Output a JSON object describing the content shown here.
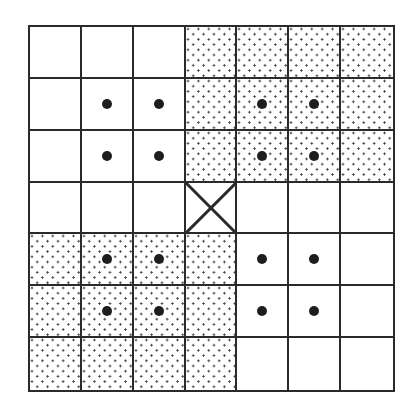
{
  "diagram": {
    "type": "grid",
    "rows": 7,
    "cols": 7,
    "colors": {
      "line": "#2a2a2a",
      "dot": "#1e1e1e",
      "stipple": "#3a3a3a",
      "background": "#ffffff"
    },
    "legend": {
      "stippled": "dotted-pattern fill",
      "marked": "large center dot",
      "center": "X-marked cell"
    },
    "cells": [
      [
        {
          "fill": "plain",
          "dot": false
        },
        {
          "fill": "plain",
          "dot": false
        },
        {
          "fill": "plain",
          "dot": false
        },
        {
          "fill": "stipple",
          "dot": false
        },
        {
          "fill": "stipple",
          "dot": false
        },
        {
          "fill": "stipple",
          "dot": false
        },
        {
          "fill": "stipple",
          "dot": false
        }
      ],
      [
        {
          "fill": "plain",
          "dot": false
        },
        {
          "fill": "plain",
          "dot": true
        },
        {
          "fill": "plain",
          "dot": true
        },
        {
          "fill": "stipple",
          "dot": false
        },
        {
          "fill": "stipple",
          "dot": true
        },
        {
          "fill": "stipple",
          "dot": true
        },
        {
          "fill": "stipple",
          "dot": false
        }
      ],
      [
        {
          "fill": "plain",
          "dot": false
        },
        {
          "fill": "plain",
          "dot": true
        },
        {
          "fill": "plain",
          "dot": true
        },
        {
          "fill": "stipple",
          "dot": false
        },
        {
          "fill": "stipple",
          "dot": true
        },
        {
          "fill": "stipple",
          "dot": true
        },
        {
          "fill": "stipple",
          "dot": false
        }
      ],
      [
        {
          "fill": "plain",
          "dot": false
        },
        {
          "fill": "plain",
          "dot": false
        },
        {
          "fill": "plain",
          "dot": false
        },
        {
          "fill": "plain",
          "dot": false,
          "x": true
        },
        {
          "fill": "plain",
          "dot": false
        },
        {
          "fill": "plain",
          "dot": false
        },
        {
          "fill": "plain",
          "dot": false
        }
      ],
      [
        {
          "fill": "stipple",
          "dot": false
        },
        {
          "fill": "stipple",
          "dot": true
        },
        {
          "fill": "stipple",
          "dot": true
        },
        {
          "fill": "stipple",
          "dot": false
        },
        {
          "fill": "plain",
          "dot": true
        },
        {
          "fill": "plain",
          "dot": true
        },
        {
          "fill": "plain",
          "dot": false
        }
      ],
      [
        {
          "fill": "stipple",
          "dot": false
        },
        {
          "fill": "stipple",
          "dot": true
        },
        {
          "fill": "stipple",
          "dot": true
        },
        {
          "fill": "stipple",
          "dot": false
        },
        {
          "fill": "plain",
          "dot": true
        },
        {
          "fill": "plain",
          "dot": true
        },
        {
          "fill": "plain",
          "dot": false
        }
      ],
      [
        {
          "fill": "stipple",
          "dot": false
        },
        {
          "fill": "stipple",
          "dot": false
        },
        {
          "fill": "stipple",
          "dot": false
        },
        {
          "fill": "stipple",
          "dot": false
        },
        {
          "fill": "plain",
          "dot": false
        },
        {
          "fill": "plain",
          "dot": false
        },
        {
          "fill": "plain",
          "dot": false
        }
      ]
    ]
  }
}
